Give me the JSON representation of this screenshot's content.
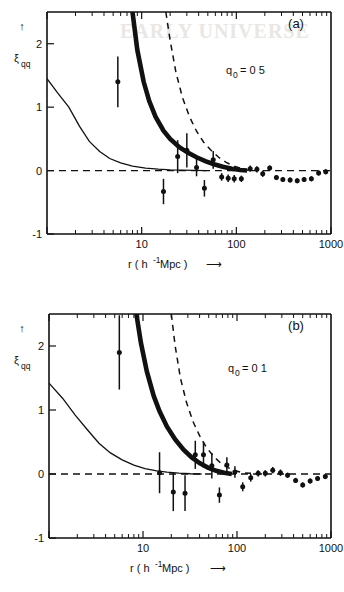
{
  "figure": {
    "panels": [
      {
        "id": "a",
        "panel_label": "(a)",
        "annotation": "q₀ = 0.5",
        "annotation_base": "q",
        "annotation_sub": "0",
        "annotation_value": "= 0 5"
      },
      {
        "id": "b",
        "panel_label": "(b)",
        "annotation": "q₀ = 0.1",
        "annotation_base": "q",
        "annotation_sub": "0",
        "annotation_value": "= 0 1"
      }
    ],
    "axes": {
      "xlabel_main": "r ( h",
      "xlabel_exp": "-1",
      "xlabel_tail": " Mpc )",
      "xlabel_arrow": "⟶",
      "ylabel_base": "ξ",
      "ylabel_sub": "qq",
      "ylabel_arrow": "↑",
      "xticks": [
        "10",
        "100",
        "1000"
      ],
      "yticks": [
        "2",
        "1",
        "0",
        "-1"
      ],
      "xlim": [
        1,
        1000
      ],
      "ylim": [
        -1,
        2.5
      ],
      "xscale": "log",
      "yscale": "linear",
      "grid": false
    },
    "bleed_text_a": "EARLY UNIVERSE"
  },
  "chart_data": [
    {
      "type": "scatter",
      "panel": "a",
      "title": "",
      "xlabel": "r ( h^-1 Mpc )",
      "ylabel": "xi_qq",
      "xlim": [
        1,
        1000
      ],
      "ylim": [
        -1,
        2.5
      ],
      "xscale": "log",
      "grid": false,
      "legend": "none",
      "annotation": "q0 = 0.5",
      "points": {
        "x": [
          5.6,
          17,
          24,
          30,
          38,
          46,
          57,
          70,
          82,
          95,
          113,
          140,
          165,
          190,
          225,
          265,
          310,
          370,
          440,
          520,
          620,
          740,
          880
        ],
        "y": [
          1.4,
          -0.33,
          0.22,
          0.32,
          0.05,
          -0.28,
          0.17,
          -0.1,
          -0.12,
          -0.13,
          -0.13,
          0.03,
          0.02,
          -0.05,
          0.04,
          -0.11,
          -0.14,
          -0.15,
          -0.16,
          -0.14,
          -0.13,
          -0.04,
          -0.02
        ],
        "yerr": [
          0.4,
          0.2,
          0.26,
          0.27,
          0.14,
          0.13,
          0.14,
          0.06,
          0.06,
          0.06,
          0.05,
          0.05,
          0.05,
          0.05,
          0.04,
          0.04,
          0.04,
          0.04,
          0.04,
          0.04,
          0.04,
          0.04,
          0.04
        ]
      },
      "curves": [
        {
          "name": "galaxy-correlation-thin",
          "style": "thin-solid",
          "x": [
            1.0,
            1.3,
            1.7,
            2.2,
            2.8,
            3.6,
            4.6,
            6.0,
            8.0,
            11,
            15,
            20,
            27,
            36,
            48
          ],
          "y": [
            1.45,
            1.22,
            1.0,
            0.7,
            0.46,
            0.3,
            0.19,
            0.12,
            0.07,
            0.04,
            0.022,
            0.012,
            0.006,
            0.003,
            0.0
          ]
        },
        {
          "name": "model-thick",
          "style": "thick-solid",
          "x": [
            8.0,
            9.0,
            10.5,
            12,
            14,
            17,
            20,
            25,
            31,
            38,
            47,
            58,
            72,
            90,
            110,
            130
          ],
          "y": [
            2.5,
            1.9,
            1.4,
            1.1,
            0.85,
            0.63,
            0.5,
            0.37,
            0.28,
            0.21,
            0.15,
            0.1,
            0.06,
            0.03,
            0.01,
            0.0
          ]
        },
        {
          "name": "model-dashed",
          "style": "dashed",
          "x": [
            18,
            20,
            23,
            27,
            32,
            38,
            45,
            54,
            65,
            78,
            95,
            115,
            135
          ],
          "y": [
            2.5,
            2.05,
            1.55,
            1.15,
            0.85,
            0.62,
            0.45,
            0.32,
            0.21,
            0.13,
            0.07,
            0.03,
            0.0
          ]
        }
      ]
    },
    {
      "type": "scatter",
      "panel": "b",
      "title": "",
      "xlabel": "r ( h^-1 Mpc )",
      "ylabel": "xi_qq",
      "xlim": [
        1,
        1000
      ],
      "ylim": [
        -1,
        2.5
      ],
      "xscale": "log",
      "grid": false,
      "legend": "none",
      "annotation": "q0 = 0.1",
      "points": {
        "x": [
          5.6,
          15,
          21,
          28,
          36,
          44,
          54,
          65,
          78,
          95,
          115,
          140,
          168,
          200,
          240,
          290,
          345,
          420,
          500,
          600,
          720,
          870
        ],
        "y": [
          1.9,
          0.02,
          -0.28,
          -0.3,
          0.3,
          0.3,
          0.13,
          -0.33,
          0.14,
          0.03,
          -0.2,
          -0.06,
          0.01,
          0.01,
          0.06,
          0.02,
          -0.02,
          -0.1,
          -0.17,
          -0.11,
          -0.07,
          -0.04
        ],
        "yerr": [
          0.58,
          0.32,
          0.3,
          0.28,
          0.22,
          0.2,
          0.2,
          0.12,
          0.12,
          0.09,
          0.07,
          0.06,
          0.05,
          0.05,
          0.05,
          0.05,
          0.04,
          0.04,
          0.04,
          0.04,
          0.04,
          0.04
        ]
      },
      "curves": [
        {
          "name": "galaxy-correlation-thin",
          "style": "thin-solid",
          "x": [
            1.0,
            1.4,
            1.9,
            2.6,
            3.4,
            4.5,
            6.0,
            8.0,
            10.5,
            14,
            18,
            24,
            32,
            42
          ],
          "y": [
            1.42,
            1.18,
            0.92,
            0.68,
            0.48,
            0.33,
            0.22,
            0.14,
            0.085,
            0.05,
            0.028,
            0.013,
            0.004,
            0.0
          ]
        },
        {
          "name": "model-thick",
          "style": "thick-solid",
          "x": [
            8.5,
            9.5,
            11,
            13,
            15,
            18,
            22,
            27,
            33,
            40,
            49,
            60,
            73,
            88
          ],
          "y": [
            2.5,
            2.05,
            1.6,
            1.22,
            0.98,
            0.74,
            0.54,
            0.38,
            0.26,
            0.17,
            0.1,
            0.05,
            0.02,
            0.0
          ]
        },
        {
          "name": "model-dashed",
          "style": "dashed",
          "x": [
            20,
            22,
            25,
            29,
            34,
            40,
            47,
            56,
            67,
            80,
            96,
            115,
            140,
            170,
            205
          ],
          "y": [
            2.5,
            2.0,
            1.5,
            1.12,
            0.82,
            0.6,
            0.42,
            0.28,
            0.17,
            0.1,
            0.05,
            0.02,
            0.01,
            0.0,
            0.0
          ]
        }
      ]
    }
  ]
}
